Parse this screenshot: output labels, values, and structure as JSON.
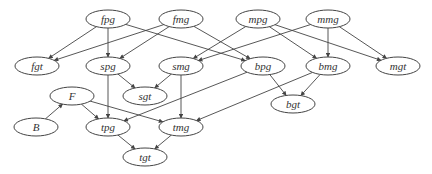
{
  "diagram": {
    "type": "directed-graph",
    "colors": {
      "stroke": "#444444",
      "text": "#333333",
      "background": "#ffffff"
    },
    "nodes": [
      {
        "id": "fpg",
        "label": "fpg",
        "x": 108,
        "y": 19
      },
      {
        "id": "fmg",
        "label": "fmg",
        "x": 181,
        "y": 19
      },
      {
        "id": "mpg",
        "label": "mpg",
        "x": 258,
        "y": 19
      },
      {
        "id": "mmg",
        "label": "mmg",
        "x": 328,
        "y": 19
      },
      {
        "id": "fgt",
        "label": "fgt",
        "x": 37,
        "y": 66
      },
      {
        "id": "spg",
        "label": "spg",
        "x": 108,
        "y": 66
      },
      {
        "id": "smg",
        "label": "smg",
        "x": 181,
        "y": 66
      },
      {
        "id": "bpg",
        "label": "bpg",
        "x": 263,
        "y": 66
      },
      {
        "id": "bmg",
        "label": "bmg",
        "x": 328,
        "y": 66
      },
      {
        "id": "mgt",
        "label": "mgt",
        "x": 398,
        "y": 66
      },
      {
        "id": "F",
        "label": "F",
        "x": 72,
        "y": 96
      },
      {
        "id": "sgt",
        "label": "sgt",
        "x": 145,
        "y": 96
      },
      {
        "id": "bgt",
        "label": "bgt",
        "x": 293,
        "y": 104
      },
      {
        "id": "B",
        "label": "B",
        "x": 36,
        "y": 127
      },
      {
        "id": "tpg",
        "label": "tpg",
        "x": 108,
        "y": 127
      },
      {
        "id": "tmg",
        "label": "tmg",
        "x": 181,
        "y": 127
      },
      {
        "id": "tgt",
        "label": "tgt",
        "x": 145,
        "y": 157
      }
    ],
    "edges": [
      {
        "from": "fpg",
        "to": "fgt"
      },
      {
        "from": "fpg",
        "to": "spg"
      },
      {
        "from": "fpg",
        "to": "bpg"
      },
      {
        "from": "fmg",
        "to": "fgt"
      },
      {
        "from": "fmg",
        "to": "spg"
      },
      {
        "from": "fmg",
        "to": "bpg"
      },
      {
        "from": "mpg",
        "to": "smg"
      },
      {
        "from": "mpg",
        "to": "bmg"
      },
      {
        "from": "mpg",
        "to": "mgt"
      },
      {
        "from": "mmg",
        "to": "smg"
      },
      {
        "from": "mmg",
        "to": "bmg"
      },
      {
        "from": "mmg",
        "to": "mgt"
      },
      {
        "from": "spg",
        "to": "sgt"
      },
      {
        "from": "spg",
        "to": "tpg"
      },
      {
        "from": "smg",
        "to": "sgt"
      },
      {
        "from": "smg",
        "to": "tmg"
      },
      {
        "from": "bpg",
        "to": "bgt"
      },
      {
        "from": "bpg",
        "to": "tpg"
      },
      {
        "from": "bmg",
        "to": "bgt"
      },
      {
        "from": "bmg",
        "to": "tmg"
      },
      {
        "from": "B",
        "to": "F"
      },
      {
        "from": "F",
        "to": "tpg"
      },
      {
        "from": "F",
        "to": "tmg"
      },
      {
        "from": "tpg",
        "to": "tgt"
      },
      {
        "from": "tmg",
        "to": "tgt"
      }
    ]
  }
}
